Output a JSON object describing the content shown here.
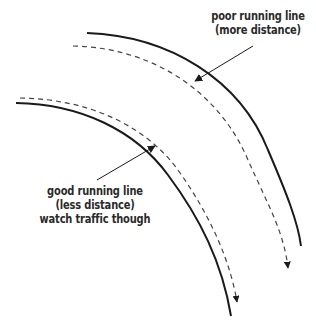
{
  "diagram": {
    "colors": {
      "background": "#ffffff",
      "line": "#1a1a1a",
      "dashed": "#444444",
      "text": "#2a2a2a"
    },
    "curves": [
      {
        "name": "outer-edge",
        "style": "solid"
      },
      {
        "name": "poor-running-line",
        "style": "dashed",
        "arrowhead": true
      },
      {
        "name": "inner-edge",
        "style": "solid"
      },
      {
        "name": "good-running-line",
        "style": "dashed",
        "arrowhead": true
      }
    ],
    "annotations": {
      "poor": {
        "lines": [
          "poor running line",
          "(more distance)"
        ]
      },
      "good": {
        "lines": [
          "good running line",
          "(less distance)",
          "watch traffic though"
        ]
      }
    }
  }
}
